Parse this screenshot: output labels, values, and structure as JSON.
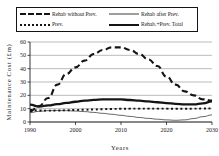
{
  "legend": {
    "entries": [
      {
        "label": "Rehab without Prev.",
        "style": "long-dash",
        "name": "legend-rehab-without-prev"
      },
      {
        "label": "Rehab after Prev.",
        "style": "thin-solid",
        "name": "legend-rehab-after-prev"
      },
      {
        "label": "Prev.",
        "style": "square-dot",
        "name": "legend-prev"
      },
      {
        "label": "Rehab.+Prev. Total",
        "style": "thick-solid",
        "name": "legend-rehab-plus-prev-total"
      }
    ]
  },
  "chart_data": {
    "type": "line",
    "title": "",
    "xlabel": "Years",
    "ylabel": "Maintenance Cost (£m)",
    "xlim": [
      1990,
      2030
    ],
    "ylim": [
      0,
      60
    ],
    "xticks": [
      1990,
      2000,
      2010,
      2020,
      2030
    ],
    "yticks": [
      0,
      10,
      20,
      30,
      40,
      50,
      60
    ],
    "grid": true,
    "legend_position": "top",
    "x": [
      1990,
      1992,
      1994,
      1996,
      1998,
      2000,
      2002,
      2004,
      2006,
      2008,
      2010,
      2012,
      2014,
      2016,
      2018,
      2020,
      2022,
      2024,
      2026,
      2028,
      2030
    ],
    "series": [
      {
        "name": "Rehab without Prev.",
        "style": "long-dash",
        "color": "#141414",
        "width": 2.1,
        "values": [
          8,
          12,
          18,
          28,
          36,
          41,
          46,
          51,
          54,
          56,
          56,
          54,
          51,
          47,
          42,
          34,
          28,
          23,
          20,
          17,
          16
        ]
      },
      {
        "name": "Rehab after Prev.",
        "style": "thin-solid",
        "color": "#3d3d3d",
        "width": 0.8,
        "values": [
          7,
          8,
          8.5,
          8.6,
          8.5,
          8.2,
          7.8,
          7.2,
          6.5,
          5.8,
          5.0,
          4.2,
          3.4,
          2.7,
          2.1,
          1.6,
          1.3,
          1.6,
          2.6,
          4.0,
          5.3
        ]
      },
      {
        "name": "Prev.",
        "style": "square-dot",
        "color": "#141414",
        "width": 1.9,
        "values": [
          9.0,
          8.6,
          8.5,
          8.6,
          8.8,
          9.0,
          9.2,
          9.4,
          9.6,
          9.8,
          9.9,
          10.0,
          10.0,
          10.0,
          10.0,
          10.0,
          9.9,
          9.9,
          10.0,
          10.1,
          10.2
        ]
      },
      {
        "name": "Rehab.+Prev. Total",
        "style": "thick-solid",
        "color": "#141414",
        "width": 2.3,
        "values": [
          13.0,
          11.6,
          12.4,
          13.4,
          14.3,
          15.2,
          16.0,
          16.6,
          16.9,
          17.0,
          16.9,
          16.5,
          16.0,
          15.4,
          14.8,
          14.2,
          13.6,
          13.2,
          13.2,
          14.0,
          15.4
        ]
      }
    ]
  }
}
